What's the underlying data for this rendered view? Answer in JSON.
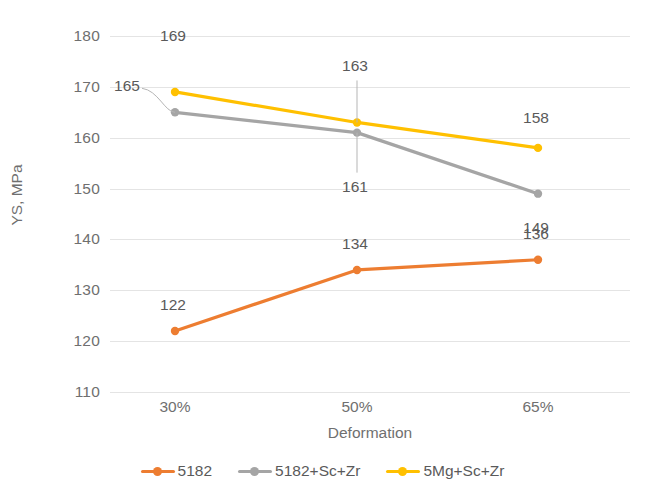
{
  "chart_data": {
    "type": "line",
    "title": "",
    "xlabel": "Deformation",
    "ylabel": "YS, MPa",
    "categories": [
      "30%",
      "50%",
      "65%"
    ],
    "ylim": [
      110,
      180
    ],
    "ytick_step": 10,
    "yticks": [
      "180",
      "170",
      "160",
      "150",
      "140",
      "130",
      "120",
      "110"
    ],
    "grid": true,
    "legend_position": "bottom",
    "series": [
      {
        "name": "5182",
        "color": "#ED7D31",
        "values": [
          122,
          134,
          136
        ],
        "labels": [
          "122",
          "134",
          "136"
        ]
      },
      {
        "name": "5182+Sc+Zr",
        "color": "#A5A5A5",
        "values": [
          165,
          161,
          149
        ],
        "labels": [
          "165",
          "161",
          "149"
        ]
      },
      {
        "name": "5Mg+Sc+Zr",
        "color": "#FFC000",
        "values": [
          169,
          163,
          158
        ],
        "labels": [
          "169",
          "163",
          "158"
        ]
      }
    ]
  }
}
